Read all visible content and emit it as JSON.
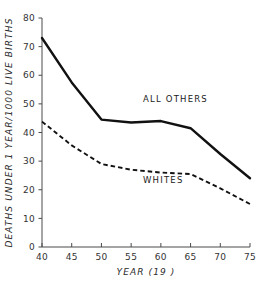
{
  "chart_data": {
    "type": "line",
    "title": "",
    "xlabel": "YEAR (19  )",
    "ylabel": "DEATHS UNDER 1 YEAR/1000 LIVE BIRTHS",
    "xlim": [
      40,
      75
    ],
    "ylim": [
      0,
      80
    ],
    "xticks": [
      40,
      45,
      50,
      55,
      60,
      65,
      70,
      75
    ],
    "yticks": [
      0,
      10,
      20,
      30,
      40,
      50,
      60,
      70,
      80
    ],
    "xtick_labels": [
      "40",
      "45",
      "50",
      "55",
      "60",
      "65",
      "70",
      "75"
    ],
    "ytick_labels": [
      "0",
      "10",
      "20",
      "30",
      "40",
      "50",
      "60",
      "70",
      "80"
    ],
    "grid": false,
    "legend_position": "inline-annotation",
    "x": [
      40,
      45,
      50,
      55,
      60,
      65,
      70,
      75
    ],
    "series": [
      {
        "name": "ALL OTHERS",
        "style": "solid",
        "values": [
          73.0,
          57.5,
          44.5,
          43.5,
          44.0,
          41.5,
          32.5,
          24.0
        ],
        "label_x": 57,
        "label_y": 50.5
      },
      {
        "name": "WHITES",
        "style": "dashed",
        "values": [
          43.8,
          35.5,
          29.0,
          27.0,
          26.0,
          25.5,
          20.5,
          15.0
        ],
        "label_x": 57,
        "label_y": 22.5
      }
    ],
    "annotations": [
      {
        "text": "ALL OTHERS",
        "series": "ALL OTHERS"
      },
      {
        "text": "WHITES",
        "series": "WHITES"
      }
    ]
  }
}
